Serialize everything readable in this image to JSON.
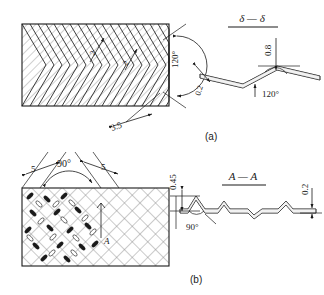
{
  "figure": {
    "background_color": "#ffffff",
    "line_color": "#1a1a1a",
    "hatch_color": "#555555"
  },
  "panel_a": {
    "caption": "(a)",
    "plan_view": {
      "name": "chevron-plate",
      "pattern": "herringbone-chevron",
      "dim_pitch": "3.5",
      "dim_depth_1": "2",
      "dim_depth_2": "2",
      "angle": "120°"
    },
    "section_view": {
      "title": "δ — δ",
      "height_dim": "0.8",
      "thickness_dim": "0.2",
      "angle": "120°"
    }
  },
  "panel_b": {
    "caption": "(b)",
    "plan_view": {
      "name": "crosshatch-plate",
      "pattern": "crosshatch-dimple",
      "dim_left": "5",
      "dim_right": "5",
      "angle": "90°",
      "section_marker": "A"
    },
    "section_view": {
      "title": "A — A",
      "height_dim": "0.45",
      "thickness_dim": "0.2",
      "angle": "90°"
    }
  }
}
